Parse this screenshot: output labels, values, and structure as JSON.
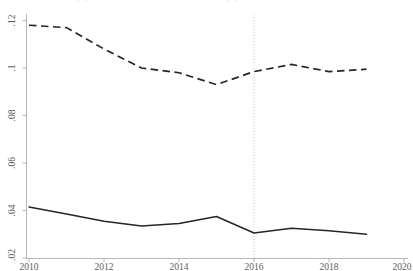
{
  "figure": {
    "title": "図3-2　日本の多国籍企業の海外売上高に占める米国・その他シェア",
    "background_color": "#ffffff",
    "line_color": "#262626",
    "axis_color": "#9a9a9a"
  },
  "chart_data": {
    "type": "line",
    "title": "",
    "xlabel": "",
    "ylabel": "",
    "x": [
      2010,
      2011,
      2012,
      2013,
      2014,
      2015,
      2016,
      2017,
      2018,
      2019
    ],
    "xlim": [
      2010,
      2020
    ],
    "ylim": [
      0.02,
      0.125
    ],
    "xticks": [
      2010,
      2012,
      2014,
      2016,
      2018,
      2020
    ],
    "xtick_labels": [
      "2010",
      "2012",
      "2014",
      "2016",
      "2018",
      "2020"
    ],
    "yticks": [
      0.02,
      0.04,
      0.06,
      0.08,
      0.1,
      0.12
    ],
    "ytick_labels": [
      ".02",
      ".04",
      ".06",
      ".08",
      ".1",
      ".12"
    ],
    "grid": false,
    "legend": "none",
    "series": [
      {
        "name": "dashed-series",
        "style": "dashed",
        "values": [
          0.118,
          0.117,
          0.108,
          0.1,
          0.098,
          0.093,
          0.0985,
          0.1015,
          0.0985,
          0.0995
        ]
      },
      {
        "name": "solid-series",
        "style": "solid",
        "values": [
          0.0415,
          0.0385,
          0.0355,
          0.0335,
          0.0345,
          0.0375,
          0.0305,
          0.0325,
          0.0315,
          0.03
        ]
      }
    ],
    "annotations": [
      {
        "name": "reference-line-2016",
        "type": "vline",
        "x": 2016,
        "style": "dotted"
      }
    ]
  }
}
